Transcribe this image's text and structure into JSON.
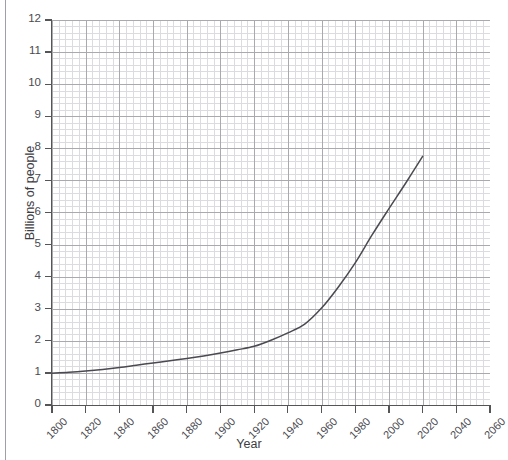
{
  "page": {
    "top_crop_artifacts": "··    ·        ···          ··        ····"
  },
  "chart_data": {
    "type": "line",
    "title": "",
    "xlabel": "Year",
    "ylabel": "Billions of people",
    "xlim": [
      1800,
      2060
    ],
    "ylim": [
      0,
      12
    ],
    "grid": true,
    "grid_minor": true,
    "legend": "none",
    "x_ticks": [
      1800,
      1820,
      1840,
      1860,
      1880,
      1900,
      1920,
      1940,
      1960,
      1980,
      2000,
      2020,
      2040,
      2060
    ],
    "y_ticks": [
      0,
      1,
      2,
      3,
      4,
      5,
      6,
      7,
      8,
      9,
      10,
      11,
      12
    ],
    "series": [
      {
        "name": "World population",
        "color": "#4a4a50",
        "x": [
          1800,
          1810,
          1820,
          1830,
          1840,
          1850,
          1860,
          1870,
          1880,
          1890,
          1900,
          1910,
          1920,
          1930,
          1940,
          1950,
          1960,
          1970,
          1980,
          1990,
          2000,
          2010,
          2020
        ],
        "values": [
          0.99,
          1.02,
          1.06,
          1.11,
          1.17,
          1.24,
          1.31,
          1.38,
          1.45,
          1.53,
          1.62,
          1.72,
          1.83,
          2.02,
          2.25,
          2.52,
          3.02,
          3.68,
          4.43,
          5.3,
          6.12,
          6.92,
          7.75
        ]
      }
    ]
  }
}
